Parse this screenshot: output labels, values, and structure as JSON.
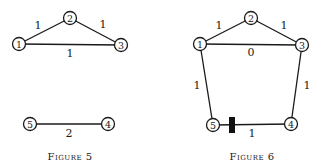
{
  "figures": [
    {
      "caption": "Figure 5",
      "nodes": [
        {
          "id": "1",
          "label": "1",
          "x": 19,
          "y": 44
        },
        {
          "id": "2",
          "label": "2",
          "x": 70,
          "y": 18
        },
        {
          "id": "3",
          "label": "3",
          "x": 121,
          "y": 45
        },
        {
          "id": "5",
          "label": "5",
          "x": 30,
          "y": 124
        },
        {
          "id": "4",
          "label": "4",
          "x": 108,
          "y": 124
        }
      ],
      "edges": [
        {
          "from": "1",
          "to": "2",
          "weight": "1"
        },
        {
          "from": "2",
          "to": "3",
          "weight": "1"
        },
        {
          "from": "1",
          "to": "3",
          "weight": "1"
        },
        {
          "from": "5",
          "to": "4",
          "weight": "2"
        }
      ]
    },
    {
      "caption": "Figure 6",
      "nodes": [
        {
          "id": "1",
          "label": "1",
          "x": 200,
          "y": 44
        },
        {
          "id": "2",
          "label": "2",
          "x": 251,
          "y": 18
        },
        {
          "id": "3",
          "label": "3",
          "x": 302,
          "y": 45
        },
        {
          "id": "5",
          "label": "5",
          "x": 213,
          "y": 125
        },
        {
          "id": "4",
          "label": "4",
          "x": 291,
          "y": 124
        }
      ],
      "edges": [
        {
          "from": "1",
          "to": "2",
          "weight": "1"
        },
        {
          "from": "2",
          "to": "3",
          "weight": "1"
        },
        {
          "from": "1",
          "to": "3",
          "weight": "0"
        },
        {
          "from": "1",
          "to": "5",
          "weight": "1"
        },
        {
          "from": "3",
          "to": "4",
          "weight": "1"
        },
        {
          "from": "5",
          "to": "4",
          "weight": "1",
          "marker": "block"
        }
      ]
    }
  ],
  "labels": {
    "fig5_e12": "1",
    "fig5_e23": "1",
    "fig5_e13": "1",
    "fig5_e54": "2",
    "fig5_n1": "1",
    "fig5_n2": "2",
    "fig5_n3": "3",
    "fig5_n4": "4",
    "fig5_n5": "5",
    "fig5_caption": "Figure 5",
    "fig6_e12": "1",
    "fig6_e23": "1",
    "fig6_e13": "0",
    "fig6_e15": "1",
    "fig6_e34": "1",
    "fig6_e54": "1",
    "fig6_n1": "1",
    "fig6_n2": "2",
    "fig6_n3": "3",
    "fig6_n4": "4",
    "fig6_n5": "5",
    "fig6_caption": "Figure 6"
  }
}
